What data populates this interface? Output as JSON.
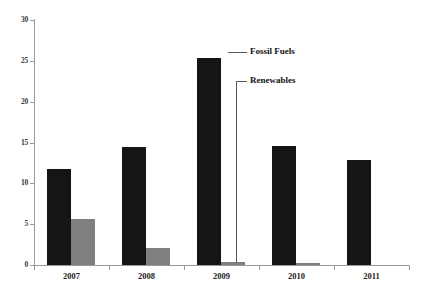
{
  "chart_data": {
    "type": "bar",
    "title": "",
    "subtitle": "",
    "xlabel": "",
    "ylabel": "",
    "categories": [
      "2007",
      "2008",
      "2009",
      "2010",
      "2011"
    ],
    "series": [
      {
        "name": "Fossil Fuels",
        "color": "#151515",
        "values": [
          11.8,
          14.4,
          25.4,
          14.6,
          12.8
        ]
      },
      {
        "name": "Renewables",
        "color": "#808080",
        "values": [
          5.6,
          2.1,
          0.4,
          0.3,
          0.0
        ]
      }
    ],
    "ylim": [
      0,
      30
    ],
    "yticks": [
      0,
      5,
      10,
      15,
      20,
      25,
      30
    ],
    "ytick_labels": [
      "0",
      "5",
      "10",
      "15",
      "20",
      "25",
      "30"
    ],
    "grid": false,
    "legend_position": "none",
    "annotations": [
      {
        "text": "Fossil Fuels",
        "points_to": "2009 Fossil Fuels bar top"
      },
      {
        "text": "Renewables",
        "points_to": "2009 Renewables bar"
      }
    ]
  },
  "axes": {
    "y_labels": [
      "30",
      "25",
      "20",
      "15",
      "10",
      "5",
      "0"
    ],
    "x_labels": [
      "2007",
      "2008",
      "2009",
      "2010",
      "2011"
    ]
  },
  "annotations": {
    "fossil_fuels": "Fossil Fuels",
    "renewables": "Renewables"
  },
  "colors": {
    "fossil": "#151515",
    "renewables": "#808080",
    "axis": "#9a9a9a",
    "background": "#ffffff",
    "leader": "#5a5a5a"
  }
}
